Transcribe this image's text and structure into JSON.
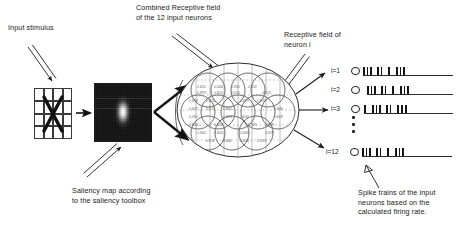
{
  "diagram": {
    "title_present": false,
    "labels": {
      "input_stimulus": "Input stimulus",
      "combined_rf": "Combined Receptive field\nof the 12 input neurons",
      "receptive_field_neuron_i": "Receptive field of\nneuron i",
      "saliency_caption": "Saliency map according\nto the saliency toolbox",
      "spike_caption": "Spike trains of the input\nneurons based on the\ncalculated firing rate."
    }
  },
  "stimulus": {
    "name": "input-stimulus-grid",
    "columns": 4,
    "rows": 4,
    "glyph": "X"
  },
  "saliency": {
    "name": "saliency-map",
    "description": "dark image with bright vertical salient blob at center"
  },
  "receptive_field": {
    "neuron_count": 12,
    "grid_columns": 4,
    "grid_rows": 3,
    "cell_values": [
      [
        "0.3415",
        "0.2446",
        "0.2941",
        "0.3202"
      ],
      [
        "0.2879",
        "0.4615",
        "0.5220",
        "0.2670"
      ],
      [
        "0.3269",
        "0.4155",
        "0.3191",
        "0.4197"
      ],
      [
        "0.3475",
        "0.4173",
        "0.3641",
        "0.3066"
      ],
      [
        "0.2905",
        "0.3674",
        "0.4261",
        "0.4059"
      ],
      [
        "0.3562",
        "0.4287",
        "0.2691",
        "0.3399"
      ],
      [
        "0.2662",
        "0.3626",
        "0.3058",
        "0.5079"
      ],
      [
        "0.3159",
        "0.4462",
        "0.4404",
        "0.3143"
      ]
    ]
  },
  "spike_trains": {
    "rows": [
      {
        "label": "i=1",
        "spikes": [
          0,
          3.5,
          7,
          14,
          17.5,
          25,
          33,
          36.5,
          40
        ]
      },
      {
        "label": "i=2",
        "spikes": [
          0,
          3.5,
          7,
          14,
          17.5,
          25,
          33,
          36.5,
          40
        ]
      },
      {
        "label": "i=3",
        "spikes": [
          0,
          8,
          11.5,
          15,
          22,
          25.5,
          33,
          37,
          41
        ]
      },
      {
        "label": "i=12",
        "spikes": [
          0,
          3.5,
          7,
          14,
          17.5,
          25,
          33,
          36.5,
          40
        ]
      }
    ],
    "ellipsis": "⋮"
  },
  "colors": {
    "ink": "#1a1a1a",
    "stroke": "#2b2b2b",
    "rf_stroke": "#6b6b6b",
    "background": "#ffffff"
  }
}
